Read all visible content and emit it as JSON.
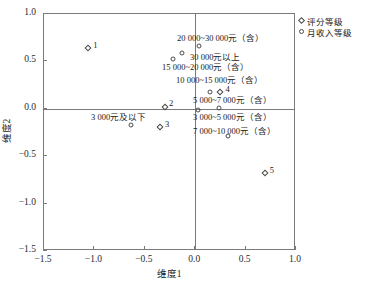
{
  "chart_data": {
    "type": "scatter",
    "title": "",
    "xlabel": "维度1",
    "ylabel": "维度2",
    "xlim": [
      -1.5,
      1.0
    ],
    "ylim": [
      -1.5,
      1.0
    ],
    "xticks": [
      "-1.5",
      "-1.0",
      "-0.5",
      "0.0",
      "0.5",
      "1.0"
    ],
    "xtick_values": [
      -1.5,
      -1.0,
      -0.5,
      0.0,
      0.5,
      1.0
    ],
    "yticks": [
      "1.0",
      "0.5",
      "0.0",
      "-0.5",
      "-1.0",
      "-1.5"
    ],
    "ytick_values": [
      1.0,
      0.5,
      0.0,
      -0.5,
      -1.0,
      -1.5
    ],
    "grid": false,
    "zero_lines": true,
    "legend_position": "outside-top-right",
    "legend": [
      {
        "label": "评分等级",
        "marker": "diamond"
      },
      {
        "label": "月收入等级",
        "marker": "circle"
      }
    ],
    "series": [
      {
        "name": "评分等级",
        "marker": "diamond",
        "points": [
          {
            "label": "1",
            "x": -1.06,
            "y": 0.64,
            "label_dx": 5,
            "label_dy": -7
          },
          {
            "label": "2",
            "x": -0.3,
            "y": 0.02,
            "label_dx": 4,
            "label_dy": -8
          },
          {
            "label": "3",
            "x": -0.35,
            "y": -0.19,
            "label_dx": 5,
            "label_dy": -7
          },
          {
            "label": "4",
            "x": 0.25,
            "y": 0.18,
            "label_dx": 5,
            "label_dy": -7
          },
          {
            "label": "5",
            "x": 0.69,
            "y": -0.68,
            "label_dx": 5,
            "label_dy": -7
          }
        ]
      },
      {
        "name": "月收入等级",
        "marker": "circle",
        "points": [
          {
            "label": "20 000~30 000元（含）",
            "x": 0.04,
            "y": 0.66
          },
          {
            "label": "30 000元以上",
            "x": -0.13,
            "y": 0.59
          },
          {
            "label": "15 000~20 000元（含）",
            "x": -0.22,
            "y": 0.53
          },
          {
            "label": "10 000~15 000元（含）",
            "x": 0.15,
            "y": 0.18
          },
          {
            "label": "5 000~7 000元（含）",
            "x": 0.03,
            "y": -0.01
          },
          {
            "label": "3 000~5 000元（含）",
            "x": 0.24,
            "y": 0.01
          },
          {
            "label": "3 000元及以下",
            "x": -0.64,
            "y": -0.17
          },
          {
            "label": "7 000~10 000元（含）",
            "x": 0.33,
            "y": -0.29
          }
        ]
      }
    ],
    "annotations": [
      {
        "text": "20 000~30 000元（含）",
        "x_px": 176,
        "y_px": 33
      },
      {
        "text": "30 000元以上",
        "x_px": 189,
        "y_px": 52
      },
      {
        "text": "15 000~20 000元（含）",
        "x_px": 161,
        "y_px": 62
      },
      {
        "text": "10 000~15 000元（含）",
        "x_px": 175,
        "y_px": 75
      },
      {
        "text": "5 000~7 000元（含）",
        "x_px": 192,
        "y_px": 95
      },
      {
        "text": "3 000元及以下",
        "x_px": 90,
        "y_px": 112
      },
      {
        "text": "3 000~5 000元（含）",
        "x_px": 192,
        "y_px": 112
      },
      {
        "text": "7 000~10 000元（含）",
        "x_px": 192,
        "y_px": 126
      }
    ]
  }
}
